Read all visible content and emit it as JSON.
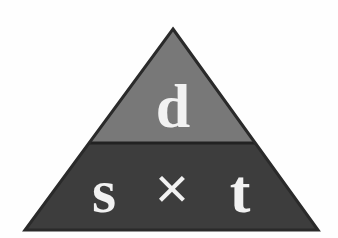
{
  "figure": {
    "name": "speed-distance-time-triangle",
    "background_color": "#fefefe"
  },
  "triangle": {
    "apex": {
      "x": 173,
      "y": 29
    },
    "base_left": {
      "x": 25,
      "y": 230
    },
    "base_right": {
      "x": 318,
      "y": 230
    },
    "divider_y": 143,
    "outline_color": "#2a2a2a",
    "outline_width": 2
  },
  "sections": {
    "top": {
      "name": "distance-section",
      "fill_color": "#787878",
      "label": "d",
      "label_color": "#f2f2f2",
      "label_x": 173,
      "label_y": 127
    },
    "bottom": {
      "name": "speed-time-section",
      "fill_color": "#3d3d3d",
      "label_color": "#f2f2f2",
      "cells": [
        {
          "name": "speed-cell",
          "label": "s",
          "x": 104,
          "y": 212
        },
        {
          "name": "multiply-operator",
          "label": "×",
          "x": 172,
          "y": 208
        },
        {
          "name": "time-cell",
          "label": "t",
          "x": 240,
          "y": 212
        }
      ]
    }
  }
}
